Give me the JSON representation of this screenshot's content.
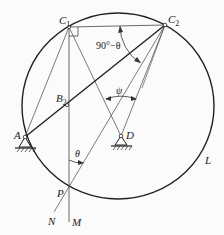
{
  "figure": {
    "points": {
      "C1": {
        "label": "C",
        "sub": "1",
        "x": 69,
        "y": 27
      },
      "C2": {
        "label": "C",
        "sub": "2",
        "x": 165,
        "y": 25
      },
      "B2": {
        "label": "B",
        "sub": "2",
        "x": 67,
        "y": 105
      },
      "A": {
        "label": "A",
        "x": 25,
        "y": 137
      },
      "D": {
        "label": "D",
        "x": 121,
        "y": 136
      },
      "P": {
        "label": "P",
        "x": 69,
        "y": 187
      },
      "N": {
        "label": "N",
        "x": 52,
        "y": 215
      },
      "M": {
        "label": "M",
        "x": 69,
        "y": 218
      }
    },
    "circle_label": "L",
    "angles": {
      "top": "90°−θ",
      "psi": "ψ",
      "theta": "θ"
    },
    "colors": {
      "stroke": "#222222",
      "thin": "#444444",
      "background": "#fbfbfb"
    }
  }
}
